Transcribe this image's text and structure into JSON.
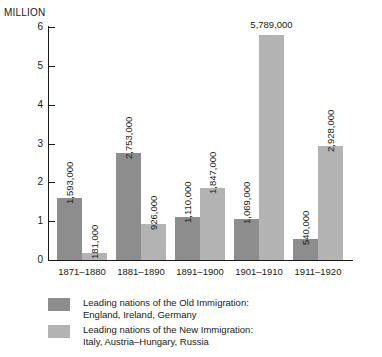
{
  "axis": {
    "unit_caption": "MILLION",
    "y_ticks": [
      "0",
      "1",
      "2",
      "3",
      "4",
      "5",
      "6"
    ]
  },
  "legend": [
    {
      "swatch": "old",
      "line1": "Leading nations of the Old Immigration:",
      "line2": "England, Ireland, Germany"
    },
    {
      "swatch": "new",
      "line1": "Leading nations of the New Immigration:",
      "line2": "Italy, Austria–Hungary, Russia"
    }
  ],
  "chart_data": {
    "type": "bar",
    "title": "",
    "subtitle": "",
    "xlabel": "",
    "ylabel": "MILLION",
    "ylim": [
      0,
      6
    ],
    "yticks": [
      0,
      1,
      2,
      3,
      4,
      5,
      6
    ],
    "grid": false,
    "legend_position": "bottom-left",
    "categories": [
      "1871–1880",
      "1881–1890",
      "1891–1900",
      "1901–1910",
      "1911–1920"
    ],
    "series": [
      {
        "name": "Leading nations of the Old Immigration: England, Ireland, Germany",
        "color": "#8d8d8d",
        "values": [
          1593000,
          2753000,
          1110000,
          1069000,
          540000
        ],
        "labels": [
          "1,593,000",
          "2,753,000",
          "1,110,000",
          "1,069,000",
          "540,000"
        ],
        "label_orientation": [
          "vertical",
          "vertical",
          "vertical",
          "vertical",
          "vertical"
        ]
      },
      {
        "name": "Leading nations of the New Immigration: Italy, Austria–Hungary, Russia",
        "color": "#b3b3b3",
        "values": [
          181000,
          926000,
          1847000,
          5789000,
          2928000
        ],
        "labels": [
          "181,000",
          "926,000",
          "1,847,000",
          "5,789,000",
          "2,928,000"
        ],
        "label_orientation": [
          "vertical",
          "vertical",
          "vertical",
          "horizontal",
          "vertical"
        ]
      }
    ]
  }
}
